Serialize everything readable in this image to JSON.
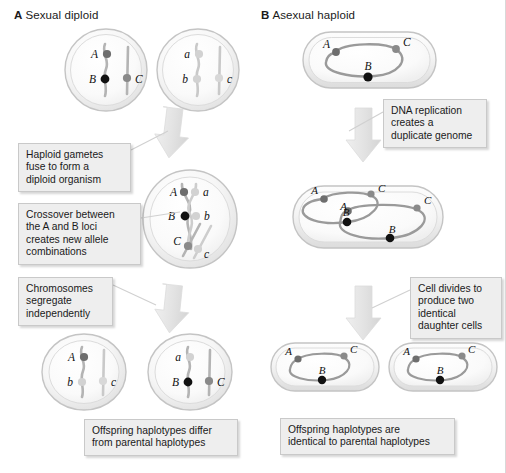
{
  "figure": {
    "width": 506,
    "height": 473,
    "background": "#ffffff",
    "type": "biology-diagram"
  },
  "panels": [
    {
      "id": "A",
      "letter": "A",
      "title": "Sexual diploid",
      "label_full": "A Sexual diploid"
    },
    {
      "id": "B",
      "letter": "B",
      "title": "Asexual haploid",
      "label_full": "B Asexual haploid"
    }
  ],
  "callouts": [
    {
      "id": "co1",
      "text": "Haploid gametes\nfuse to form a\ndiploid organism"
    },
    {
      "id": "co2",
      "text": "Crossover between\nthe A and B loci\ncreates new allele\ncombinations"
    },
    {
      "id": "co3",
      "text": "Chromosomes\nsegregate\nindependently"
    },
    {
      "id": "co4",
      "text": "Offspring haplotypes differ\nfrom parental haplotypes"
    },
    {
      "id": "co5",
      "text": "DNA replication\ncreates a\nduplicate genome"
    },
    {
      "id": "co6",
      "text": "Cell divides to\nproduce two\nidentical\ndaughter cells"
    },
    {
      "id": "co7",
      "text": "Offspring haplotypes are\nidentical to parental haplotypes"
    }
  ],
  "alleles": {
    "colors": {
      "dominant_A": "#6e6e6e",
      "dominant_B": "#111111",
      "dominant_C": "#8a8a8a",
      "recessive": "#d2d2d2",
      "chromosome": "#b4b4b4",
      "genome_loop": "#8f8f8f",
      "cell_fill": "#f2f2f2",
      "cell_stroke": "#bdbdbd",
      "arrow": "#e2e2e2",
      "callout_bg": "#eeeeee",
      "callout_border": "#c9c9c9"
    },
    "labels": {
      "A_upper": "A",
      "B_upper": "B",
      "C_upper": "C",
      "a_lower": "a",
      "b_lower": "b",
      "c_lower": "c"
    }
  },
  "panel_a_cells": [
    {
      "name": "gamete-1",
      "loci": [
        "A",
        "B",
        "C"
      ],
      "ploidy": "haploid"
    },
    {
      "name": "gamete-2",
      "loci": [
        "a",
        "b",
        "c"
      ],
      "ploidy": "haploid"
    },
    {
      "name": "zygote",
      "loci": [
        "A",
        "a",
        "B",
        "b",
        "C",
        "c"
      ],
      "ploidy": "diploid"
    },
    {
      "name": "offspring-1",
      "loci": [
        "A",
        "b",
        "c"
      ],
      "ploidy": "haploid"
    },
    {
      "name": "offspring-2",
      "loci": [
        "a",
        "B",
        "C"
      ],
      "ploidy": "haploid"
    }
  ],
  "panel_b_cells": [
    {
      "name": "parent-cell",
      "loci": [
        "A",
        "B",
        "C"
      ],
      "genomes": 1
    },
    {
      "name": "replicated-cell",
      "loci": [
        "A",
        "B",
        "C",
        "A",
        "B",
        "C"
      ],
      "genomes": 2
    },
    {
      "name": "daughter-cell-1",
      "loci": [
        "A",
        "B",
        "C"
      ],
      "genomes": 1
    },
    {
      "name": "daughter-cell-2",
      "loci": [
        "A",
        "B",
        "C"
      ],
      "genomes": 1
    }
  ]
}
